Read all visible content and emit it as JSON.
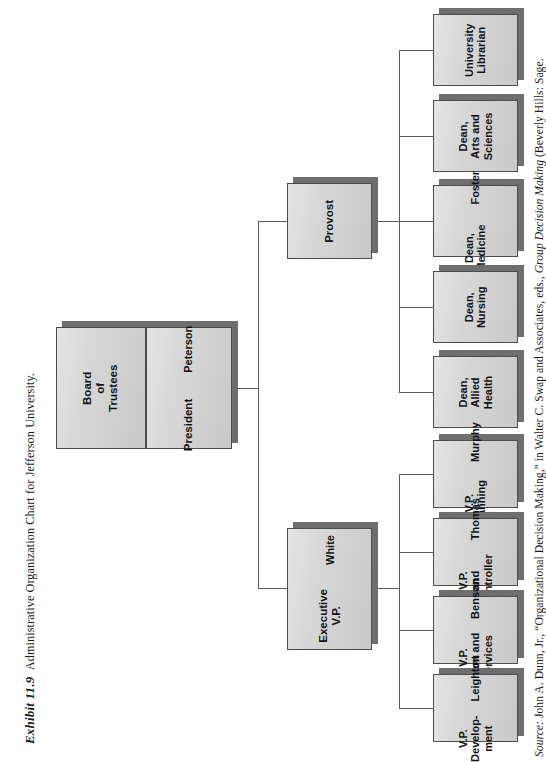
{
  "exhibit": {
    "number": "Exhibit 11.9",
    "title": "Administrative Organization Chart for Jefferson University."
  },
  "source": {
    "label": "Source:",
    "prefix": " John A. Dunn, Jr., “Organizational Decision Making,” in Walter C. Swap and Associates, eds., ",
    "italic_title": "Group Decision Making",
    "suffix": " (Beverly Hills: Sage."
  },
  "colors": {
    "box_fill": "#d4d4d4",
    "box_border": "#4c4c4c",
    "box_shadow": "#6e6e6e",
    "line": "#5a5a5a",
    "text": "#111111",
    "page_background": "#ffffff"
  },
  "chart_data": {
    "type": "org-chart",
    "orientation": "left-to-right",
    "text_rotation_degrees": -90,
    "nodes": [
      {
        "id": "board",
        "title": "Board\nof\nTrustees",
        "person": "",
        "level": 0
      },
      {
        "id": "president",
        "title": "President",
        "person": "Peterson",
        "level": 1
      },
      {
        "id": "provost",
        "title": "Provost",
        "person": "",
        "level": 2
      },
      {
        "id": "execvp",
        "title": "Executive\nV.P.",
        "person": "White",
        "level": 2
      },
      {
        "id": "dean-allied",
        "title": "Dean,\nAllied\nHealth",
        "person": "",
        "level": 3
      },
      {
        "id": "dean-nursing",
        "title": "Dean,\nNursing",
        "person": "",
        "level": 3
      },
      {
        "id": "dean-med",
        "title": "Dean,\nMedicine",
        "person": "Foster",
        "level": 3
      },
      {
        "id": "dean-arts",
        "title": "Dean,\nArts and\nSciences",
        "person": "",
        "level": 3
      },
      {
        "id": "librarian",
        "title": "University\nLibrarian",
        "person": "",
        "level": 3
      },
      {
        "id": "vp-dev",
        "title": "V.P.\nDevelop-\nment",
        "person": "Leighton",
        "level": 3
      },
      {
        "id": "vp-plant",
        "title": "V.P.\nPlant and\nServices",
        "person": "Benson",
        "level": 3
      },
      {
        "id": "vp-ctrl",
        "title": "V.P.\nand\nController",
        "person": "Thomas",
        "level": 3
      },
      {
        "id": "vp-plan",
        "title": "V.P.\nPlanning",
        "person": "Murphy",
        "level": 3
      }
    ],
    "edges": [
      {
        "from": "board",
        "to": "president"
      },
      {
        "from": "president",
        "to": "provost"
      },
      {
        "from": "president",
        "to": "execvp"
      },
      {
        "from": "provost",
        "to": "dean-allied"
      },
      {
        "from": "provost",
        "to": "dean-nursing"
      },
      {
        "from": "provost",
        "to": "dean-med"
      },
      {
        "from": "provost",
        "to": "dean-arts"
      },
      {
        "from": "provost",
        "to": "librarian"
      },
      {
        "from": "execvp",
        "to": "vp-dev"
      },
      {
        "from": "execvp",
        "to": "vp-plant"
      },
      {
        "from": "execvp",
        "to": "vp-ctrl"
      },
      {
        "from": "execvp",
        "to": "vp-plan"
      }
    ]
  },
  "nodes": {
    "board": {
      "title": "Board\nof\nTrustees",
      "person": ""
    },
    "president": {
      "title": "President",
      "person": "Peterson"
    },
    "provost": {
      "title": "Provost",
      "person": ""
    },
    "execvp": {
      "title": "Executive\nV.P.",
      "person": "White"
    },
    "dean_allied": {
      "title": "Dean,\nAllied\nHealth",
      "person": ""
    },
    "dean_nursing": {
      "title": "Dean,\nNursing",
      "person": ""
    },
    "dean_med": {
      "title": "Dean,\nMedicine",
      "person": "Foster"
    },
    "dean_arts": {
      "title": "Dean,\nArts and\nSciences",
      "person": ""
    },
    "librarian": {
      "title": "University\nLibrarian",
      "person": ""
    },
    "vp_dev": {
      "title": "V.P.\nDevelop-\nment",
      "person": "Leighton"
    },
    "vp_plant": {
      "title": "V.P.\nPlant and\nServices",
      "person": "Benson"
    },
    "vp_ctrl": {
      "title": "V.P.\nand\nController",
      "person": "Thomas"
    },
    "vp_plan": {
      "title": "V.P.\nPlanning",
      "person": "Murphy"
    }
  }
}
